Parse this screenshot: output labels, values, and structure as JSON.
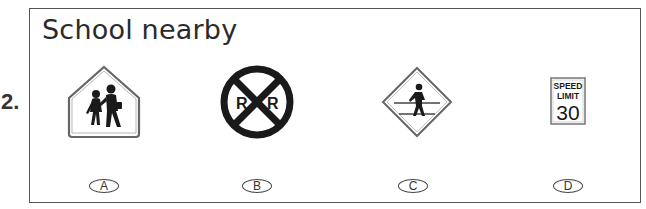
{
  "question": {
    "number": "2.",
    "title": "School nearby"
  },
  "options": [
    {
      "letter": "A",
      "sign": "school-zone-sign",
      "description": "Pentagon sign with two children walking"
    },
    {
      "letter": "B",
      "sign": "railroad-crossing-sign",
      "description": "Round sign with X and R R"
    },
    {
      "letter": "C",
      "sign": "pedestrian-crossing-sign",
      "description": "Diamond sign with walking pedestrian between lines"
    },
    {
      "letter": "D",
      "sign": "speed-limit-sign",
      "speed_label": "SPEED",
      "limit_label": "LIMIT",
      "value": "30"
    }
  ],
  "railroad": {
    "left": "R",
    "right": "R"
  },
  "colors": {
    "border": "#555555",
    "sign_black": "#1a1a1a",
    "sign_outline": "#666666"
  }
}
